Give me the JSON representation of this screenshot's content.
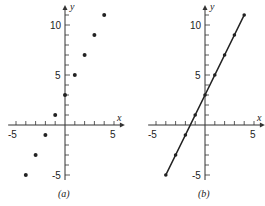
{
  "chart_data": [
    {
      "type": "scatter",
      "panel_label": "(a)",
      "title": "",
      "xlabel": "x",
      "ylabel": "y",
      "xlim": [
        -5,
        5
      ],
      "ylim": [
        -5,
        11
      ],
      "x_tick_labels": [
        "-5",
        "5"
      ],
      "y_tick_labels": [
        "10",
        "5",
        "-5"
      ],
      "grid": false,
      "series": [
        {
          "name": "points",
          "x": [
            -4,
            -3,
            -2,
            -1,
            0,
            1,
            2,
            3,
            4
          ],
          "y": [
            -5,
            -3,
            -1,
            1,
            3,
            5,
            7,
            9,
            11
          ]
        }
      ]
    },
    {
      "type": "line",
      "panel_label": "(b)",
      "title": "",
      "xlabel": "x",
      "ylabel": "y",
      "xlim": [
        -5,
        5
      ],
      "ylim": [
        -5,
        11
      ],
      "x_tick_labels": [
        "-5",
        "5"
      ],
      "y_tick_labels": [
        "10",
        "5",
        "-5"
      ],
      "grid": false,
      "series": [
        {
          "name": "y = 2x + 3",
          "x": [
            -4,
            -3,
            -2,
            -1,
            0,
            1,
            2,
            3,
            4
          ],
          "y": [
            -5,
            -3,
            -1,
            1,
            3,
            5,
            7,
            9,
            11
          ],
          "markers": true
        }
      ]
    }
  ],
  "labels": {
    "a": {
      "caption": "(a)",
      "x_axis": "x",
      "y_axis": "y",
      "tick_x_neg5": "-5",
      "tick_x_5": "5",
      "tick_y_10": "10",
      "tick_y_5": "5",
      "tick_y_neg5": "-5"
    },
    "b": {
      "caption": "(b)",
      "x_axis": "x",
      "y_axis": "y",
      "tick_x_neg5": "-5",
      "tick_x_5": "5",
      "tick_y_10": "10",
      "tick_y_5": "5",
      "tick_y_neg5": "-5"
    }
  }
}
